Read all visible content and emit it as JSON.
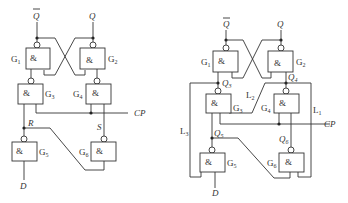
{
  "figure": {
    "left_circuit": {
      "outputs": {
        "q_bar": "Q",
        "q": "Q"
      },
      "gates": [
        {
          "id": "G1",
          "name": "G",
          "sub": "1",
          "symbol": "&"
        },
        {
          "id": "G2",
          "name": "G",
          "sub": "2",
          "symbol": "&"
        },
        {
          "id": "G3",
          "name": "G",
          "sub": "3",
          "symbol": "&"
        },
        {
          "id": "G4",
          "name": "G",
          "sub": "4",
          "symbol": "&"
        },
        {
          "id": "G5",
          "name": "G",
          "sub": "5",
          "symbol": "&"
        },
        {
          "id": "G6",
          "name": "G",
          "sub": "6",
          "symbol": "&"
        }
      ],
      "signals": {
        "cp": "CP",
        "r": "R",
        "s": "S",
        "d": "D"
      }
    },
    "right_circuit": {
      "outputs": {
        "q_bar": "Q",
        "q": "Q"
      },
      "gates": [
        {
          "id": "G1",
          "name": "G",
          "sub": "1",
          "symbol": "&"
        },
        {
          "id": "G2",
          "name": "G",
          "sub": "2",
          "symbol": "&"
        },
        {
          "id": "G3",
          "name": "G",
          "sub": "3",
          "symbol": "&"
        },
        {
          "id": "G4",
          "name": "G",
          "sub": "4",
          "symbol": "&"
        },
        {
          "id": "G5",
          "name": "G",
          "sub": "5",
          "symbol": "&"
        },
        {
          "id": "G6",
          "name": "G",
          "sub": "6",
          "symbol": "&"
        }
      ],
      "nodes": [
        {
          "name": "Q",
          "sub": "3"
        },
        {
          "name": "Q",
          "sub": "4"
        },
        {
          "name": "Q",
          "sub": "5"
        },
        {
          "name": "Q",
          "sub": "6"
        }
      ],
      "lines": [
        {
          "name": "L",
          "sub": "1"
        },
        {
          "name": "L",
          "sub": "2"
        },
        {
          "name": "L",
          "sub": "3"
        }
      ],
      "signals": {
        "cp": "CP",
        "d": "D"
      }
    }
  }
}
